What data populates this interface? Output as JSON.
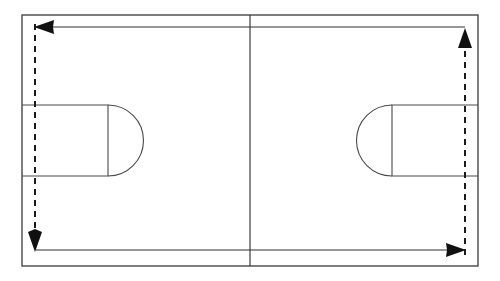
{
  "diagram": {
    "title": "Basketball Court Perimeter Movement Diagram",
    "type": "basketball-court-drill",
    "canvas": {
      "width": 500,
      "height": 281,
      "background": "#ffffff"
    },
    "colors": {
      "line": "#2b2b2b",
      "boundary": "#3a3a3a",
      "key": "#4a4a4a",
      "path_solid": "#303030",
      "path_dashed": "#1a1a1a",
      "arrow_head": "#111111",
      "court_fill": "#ffffff"
    },
    "court": {
      "name": "full-court",
      "boundary": {
        "x": 22,
        "y": 15,
        "width": 456,
        "height": 251
      },
      "center_line": {
        "x": 250,
        "y1": 15,
        "y2": 266
      },
      "left_key": {
        "name": "left-free-throw-lane",
        "x": 22,
        "y": 105,
        "width": 86,
        "height": 71,
        "arc_radius": 35,
        "arc_direction": "right"
      },
      "right_key": {
        "name": "right-free-throw-lane",
        "x": 392,
        "y": 105,
        "width": 86,
        "height": 71,
        "arc_radius": 35,
        "arc_direction": "left"
      }
    },
    "paths": {
      "top_solid": {
        "label": "top sideline run (right to left)",
        "style": "solid",
        "from": {
          "x": 465,
          "y": 27
        },
        "to": {
          "x": 38,
          "y": 27
        },
        "arrow_at": "end",
        "direction": "left"
      },
      "bottom_solid": {
        "label": "bottom sideline run (left to right)",
        "style": "solid",
        "from": {
          "x": 36,
          "y": 250
        },
        "to": {
          "x": 462,
          "y": 250
        },
        "arrow_at": "end",
        "direction": "right"
      },
      "left_dashed": {
        "label": "left baseline return (top to bottom)",
        "style": "dashed",
        "from": {
          "x": 35,
          "y": 27
        },
        "to": {
          "x": 35,
          "y": 243
        },
        "arrow_at": "end",
        "direction": "down"
      },
      "right_dashed": {
        "label": "right baseline return (bottom to top)",
        "style": "dashed",
        "from": {
          "x": 465,
          "y": 250
        },
        "to": {
          "x": 465,
          "y": 34
        },
        "arrow_at": "end",
        "direction": "up"
      }
    },
    "arrow_heads": [
      {
        "name": "arrow-head-left",
        "at": {
          "x": 38,
          "y": 27
        },
        "direction": "left"
      },
      {
        "name": "arrow-head-down",
        "at": {
          "x": 35,
          "y": 243
        },
        "direction": "down"
      },
      {
        "name": "arrow-head-right",
        "at": {
          "x": 462,
          "y": 250
        },
        "direction": "right"
      },
      {
        "name": "arrow-head-up",
        "at": {
          "x": 465,
          "y": 34
        },
        "direction": "up"
      }
    ]
  }
}
